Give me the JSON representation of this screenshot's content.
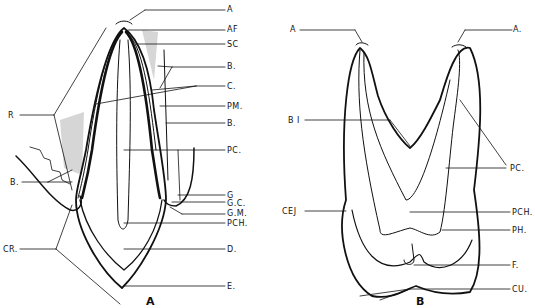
{
  "figure_a": {
    "caption": "A",
    "labels_right": [
      "A",
      "AF",
      "SC",
      "B.",
      "C.",
      "PM.",
      "B.",
      "PC.",
      "G",
      "G.C.",
      "G.M.",
      "PCH.",
      "D.",
      "E."
    ],
    "labels_left": [
      "R",
      "B.",
      "CR."
    ]
  },
  "figure_b": {
    "caption": "B",
    "labels_top": [
      "A",
      "A."
    ],
    "labels_left": [
      "B I",
      "CEJ"
    ],
    "labels_right": [
      "PC.",
      "PCH.",
      "PH.",
      "F.",
      "CU."
    ]
  }
}
